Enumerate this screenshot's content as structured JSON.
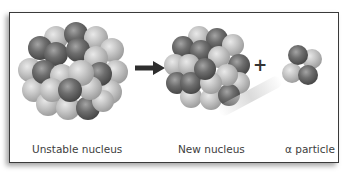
{
  "diagram": {
    "labels": {
      "unstable": "Unstable nucleus",
      "new": "New nucleus",
      "alpha": "α particle"
    },
    "operators": {
      "arrow": "→",
      "plus": "+"
    },
    "colors": {
      "proton": "#5a5a5a",
      "neutron": "#b8b8b8",
      "border": "#3a3a3a",
      "text": "#3d3d3d"
    }
  }
}
